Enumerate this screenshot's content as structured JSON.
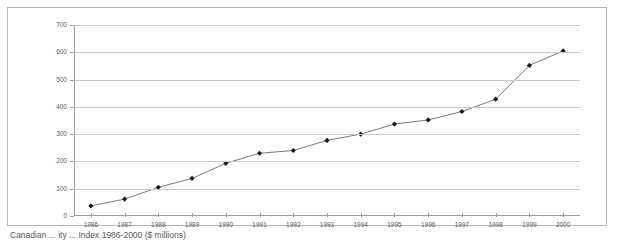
{
  "chart_data": {
    "type": "line",
    "title": "",
    "xlabel": "",
    "ylabel": "",
    "ylim": [
      0,
      700
    ],
    "ytick_step": 100,
    "grid": true,
    "legend": false,
    "marker": "diamond",
    "line_color": "#7a7a7a",
    "marker_color": "#1a1a1a",
    "grid_color": "#c9c9c9",
    "axis_color": "#9a9a9a",
    "categories": [
      "1986",
      "1987",
      "1988",
      "1989",
      "1990",
      "1991",
      "1992",
      "1993",
      "1994",
      "1995",
      "1996",
      "1997",
      "1998",
      "1999",
      "2000"
    ],
    "yticks": [
      "0",
      "100",
      "200",
      "300",
      "400",
      "500",
      "600",
      "700"
    ],
    "values": [
      37,
      62,
      105,
      138,
      193,
      230,
      240,
      277,
      300,
      337,
      352,
      383,
      428,
      552,
      605
    ],
    "series": [
      {
        "name": "",
        "values": [
          37,
          62,
          105,
          138,
          193,
          230,
          240,
          277,
          300,
          337,
          352,
          383,
          428,
          552,
          605
        ]
      }
    ]
  },
  "caption": {
    "text": "Canadian ... ity ... Index 1986-2000 ($ millions)"
  }
}
